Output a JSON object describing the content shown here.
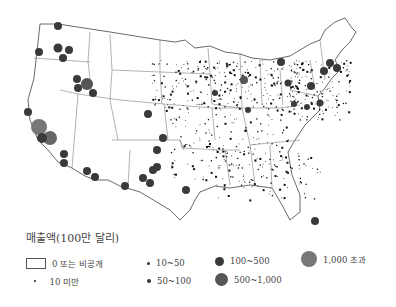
{
  "map": {
    "region": "United States (contiguous)",
    "symbol_colors": {
      "small": "#222222",
      "medium": "#3a3a3a",
      "large": "#555555",
      "xlarge": "#777777"
    }
  },
  "legend": {
    "title": "매출액(100만 달리)",
    "items": [
      {
        "label": "0 또는 비공개",
        "symbol": "empty-box"
      },
      {
        "label": "10 미만",
        "symbol": "dot-tiny"
      },
      {
        "label": "10~50",
        "symbol": "dot-small"
      },
      {
        "label": "50~100",
        "symbol": "dot-medium"
      },
      {
        "label": "100~500",
        "symbol": "circle-dark"
      },
      {
        "label": "500~1,000",
        "symbol": "circle-gray"
      },
      {
        "label": "1,000 초과",
        "symbol": "circle-large-gray"
      }
    ]
  },
  "symbols": [
    {
      "x": 58,
      "y": 26,
      "r": 4,
      "c": "#3a3a3a"
    },
    {
      "x": 58,
      "y": 48,
      "r": 4.5,
      "c": "#3a3a3a"
    },
    {
      "x": 69,
      "y": 50,
      "r": 4,
      "c": "#3a3a3a"
    },
    {
      "x": 39,
      "y": 52,
      "r": 4,
      "c": "#3a3a3a"
    },
    {
      "x": 63,
      "y": 58,
      "r": 4,
      "c": "#3a3a3a"
    },
    {
      "x": 77,
      "y": 79,
      "r": 4,
      "c": "#3a3a3a"
    },
    {
      "x": 87,
      "y": 84,
      "r": 6,
      "c": "#555"
    },
    {
      "x": 78,
      "y": 88,
      "r": 4,
      "c": "#3a3a3a"
    },
    {
      "x": 93,
      "y": 93,
      "r": 4,
      "c": "#3a3a3a"
    },
    {
      "x": 28,
      "y": 112,
      "r": 4,
      "c": "#3a3a3a"
    },
    {
      "x": 39,
      "y": 127,
      "r": 8,
      "c": "#777"
    },
    {
      "x": 50,
      "y": 138,
      "r": 7,
      "c": "#666"
    },
    {
      "x": 42,
      "y": 138,
      "r": 5,
      "c": "#3a3a3a"
    },
    {
      "x": 64,
      "y": 154,
      "r": 4,
      "c": "#3a3a3a"
    },
    {
      "x": 64,
      "y": 163,
      "r": 4,
      "c": "#3a3a3a"
    },
    {
      "x": 87,
      "y": 171,
      "r": 4,
      "c": "#3a3a3a"
    },
    {
      "x": 95,
      "y": 177,
      "r": 4,
      "c": "#3a3a3a"
    },
    {
      "x": 148,
      "y": 114,
      "r": 4,
      "c": "#3a3a3a"
    },
    {
      "x": 163,
      "y": 138,
      "r": 4,
      "c": "#3a3a3a"
    },
    {
      "x": 157,
      "y": 167,
      "r": 4,
      "c": "#3a3a3a"
    },
    {
      "x": 157,
      "y": 150,
      "r": 4,
      "c": "#3a3a3a"
    },
    {
      "x": 153,
      "y": 170,
      "r": 4,
      "c": "#3a3a3a"
    },
    {
      "x": 143,
      "y": 178,
      "r": 4,
      "c": "#3a3a3a"
    },
    {
      "x": 150,
      "y": 183,
      "r": 4,
      "c": "#3a3a3a"
    },
    {
      "x": 125,
      "y": 186,
      "r": 4,
      "c": "#3a3a3a"
    },
    {
      "x": 186,
      "y": 190,
      "r": 4,
      "c": "#3a3a3a"
    },
    {
      "x": 315,
      "y": 221,
      "r": 4,
      "c": "#3a3a3a"
    },
    {
      "x": 215,
      "y": 93,
      "r": 3,
      "c": "#3a3a3a"
    },
    {
      "x": 281,
      "y": 62,
      "r": 4,
      "c": "#3a3a3a"
    },
    {
      "x": 288,
      "y": 83,
      "r": 3.5,
      "c": "#3a3a3a"
    },
    {
      "x": 244,
      "y": 80,
      "r": 4,
      "c": "#555"
    },
    {
      "x": 248,
      "y": 110,
      "r": 3,
      "c": "#3a3a3a"
    },
    {
      "x": 330,
      "y": 63,
      "r": 4,
      "c": "#3a3a3a"
    },
    {
      "x": 324,
      "y": 71,
      "r": 4,
      "c": "#3a3a3a"
    },
    {
      "x": 337,
      "y": 68,
      "r": 4,
      "c": "#3a3a3a"
    },
    {
      "x": 311,
      "y": 86,
      "r": 4,
      "c": "#3a3a3a"
    },
    {
      "x": 320,
      "y": 103,
      "r": 3.5,
      "c": "#3a3a3a"
    },
    {
      "x": 307,
      "y": 107,
      "r": 3,
      "c": "#3a3a3a"
    },
    {
      "x": 294,
      "y": 104,
      "r": 3,
      "c": "#3a3a3a"
    }
  ],
  "dot_clusters": [
    {
      "x": 190,
      "y": 60,
      "w": 110,
      "h": 50,
      "n": 220
    },
    {
      "x": 290,
      "y": 60,
      "w": 60,
      "h": 60,
      "n": 140
    },
    {
      "x": 150,
      "y": 60,
      "w": 40,
      "h": 50,
      "n": 60
    },
    {
      "x": 170,
      "y": 110,
      "w": 120,
      "h": 70,
      "n": 160
    },
    {
      "x": 210,
      "y": 150,
      "w": 110,
      "h": 50,
      "n": 80
    }
  ]
}
